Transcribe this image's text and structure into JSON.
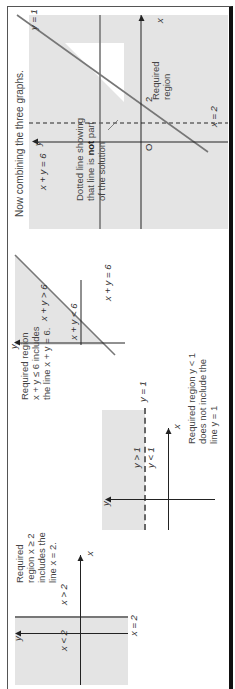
{
  "graph_x2": {
    "description": "Required region x ≥ 2 includes the line x = 2.",
    "desc_lines": [
      "Required",
      "region x ≥ 2",
      "includes the",
      "line x = 2."
    ],
    "line_label": "x = 2",
    "left_label": "x < 2",
    "right_label": "x > 2",
    "axis_x": "x",
    "axis_y": "y"
  },
  "graph_y1": {
    "desc_lines": [
      "Required region y < 1",
      "does not include the",
      "line y = 1"
    ],
    "line_label": "y = 1",
    "above_label": "y > 1",
    "below_label": "y < 1",
    "axis_x": "x",
    "axis_y": "y"
  },
  "graph_xy6": {
    "desc_lines": [
      "Required region",
      "x + y ≤ 6 includes",
      "the line x + y = 6."
    ],
    "line_label": "x + y = 6",
    "above_label": "x + y > 6",
    "below_label": "x + y < 6",
    "axis_y": "y"
  },
  "combined": {
    "title": "Now combining the three graphs.",
    "line_label_xy6": "x + y = 6",
    "line_label_y1": "y = 1",
    "line_label_x2": "x = 2",
    "region_label_lines": [
      "Required",
      "region"
    ],
    "tick_2": "2",
    "origin": "O",
    "axis_x": "x",
    "axis_y": "y",
    "note_lines": [
      "Dotted line showing",
      "that line is",
      "not",
      "part",
      "of the solution"
    ]
  }
}
